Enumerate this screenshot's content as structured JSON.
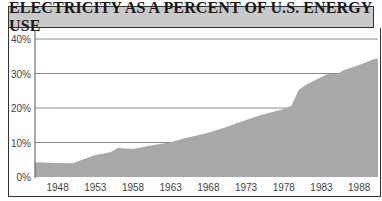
{
  "title": "ELECTRICITY AS A PERCENT OF U.S. ENERGY USE",
  "colors": {
    "title_bg": "#c9c9c9",
    "area_fill": "#a8a8a8",
    "gridline": "#888888",
    "frame": "#333333"
  },
  "chart_data": {
    "type": "area",
    "title": "ELECTRICITY AS A PERCENT OF U.S. ENERGY USE",
    "xlabel": "",
    "ylabel": "",
    "ylim": [
      0,
      40
    ],
    "xlim": [
      1945,
      1990.5
    ],
    "grid": true,
    "legend": "none",
    "y_ticks": [
      "0%",
      "10%",
      "20%",
      "30%",
      "40%"
    ],
    "x_ticks": [
      "1948",
      "1953",
      "1958",
      "1963",
      "1968",
      "1973",
      "1978",
      "1983",
      "1988"
    ],
    "series": [
      {
        "name": "Electricity share of U.S. energy use (%)",
        "x": [
          1945,
          1948,
          1950,
          1953,
          1955,
          1956,
          1958,
          1960,
          1963,
          1965,
          1968,
          1970,
          1973,
          1975,
          1978,
          1979,
          1980,
          1981,
          1983,
          1984,
          1985,
          1986,
          1988,
          1990
        ],
        "values": [
          4.3,
          4.1,
          4.0,
          6.4,
          7.2,
          8.4,
          8.1,
          9.0,
          10.1,
          11.3,
          12.8,
          14.2,
          16.5,
          18.0,
          19.7,
          20.6,
          25.2,
          26.8,
          29.0,
          30.1,
          29.8,
          31.0,
          32.5,
          34.2
        ]
      }
    ]
  }
}
